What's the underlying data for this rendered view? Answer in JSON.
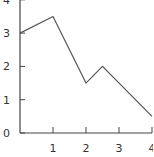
{
  "chart_data": {
    "type": "line",
    "title": "",
    "xlabel": "",
    "ylabel": "",
    "x": [
      0,
      1,
      2,
      2.5,
      4
    ],
    "series": [
      {
        "name": "series-1",
        "values": [
          3.0,
          3.5,
          1.5,
          2.0,
          0.5
        ]
      }
    ],
    "xlim": [
      0,
      4
    ],
    "ylim": [
      0,
      4
    ],
    "xticks": [
      1,
      2,
      3,
      4
    ],
    "yticks": [
      0,
      1,
      2,
      3,
      4
    ],
    "xtick_labels": [
      "1",
      "2",
      "3",
      "4"
    ],
    "ytick_labels": [
      "0",
      "1",
      "2",
      "3",
      "4"
    ],
    "grid": false,
    "legend": null,
    "line_color": "#555555",
    "axis_color": "#444444"
  }
}
